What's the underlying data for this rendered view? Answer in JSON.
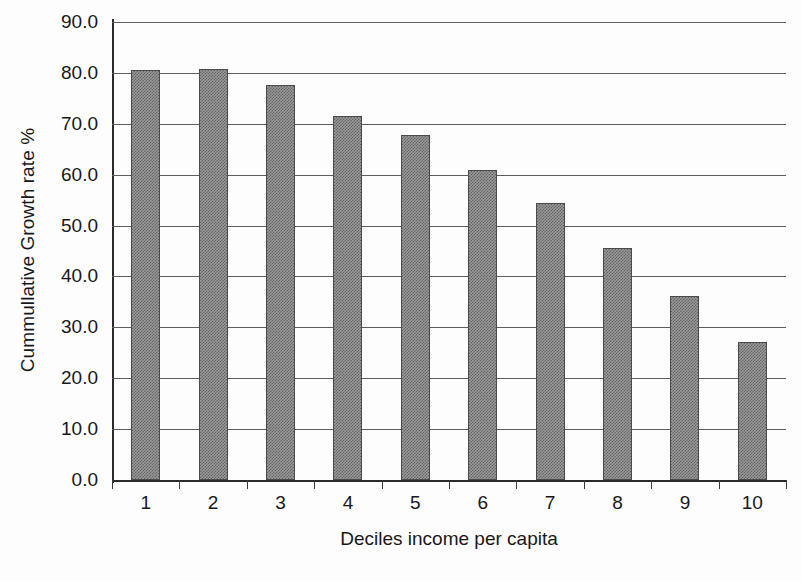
{
  "chart_data": {
    "type": "bar",
    "title": "",
    "xlabel": "Deciles income per capita",
    "ylabel": "Cummullative Growth rate %",
    "categories": [
      "1",
      "2",
      "3",
      "4",
      "5",
      "6",
      "7",
      "8",
      "9",
      "10"
    ],
    "values": [
      80.6,
      80.7,
      77.7,
      71.6,
      67.8,
      61.0,
      54.5,
      45.6,
      36.2,
      27.2
    ],
    "ylim": [
      0.0,
      90.0
    ],
    "ytick_labels": [
      "90.0",
      "80.0",
      "70.0",
      "60.0",
      "50.0",
      "40.0",
      "30.0",
      "20.0",
      "10.0",
      "0.0"
    ],
    "ytick_values": [
      90.0,
      80.0,
      70.0,
      60.0,
      50.0,
      40.0,
      30.0,
      20.0,
      10.0,
      0.0
    ],
    "grid": true,
    "legend": false,
    "legend_position": "none",
    "bar_color": "#9a9a9a",
    "bar_border_color": "#4a4a4a",
    "gridline_color": "#5d5d5d",
    "axis_color": "#2b2b2b",
    "background_color": "#fdfdfd"
  }
}
